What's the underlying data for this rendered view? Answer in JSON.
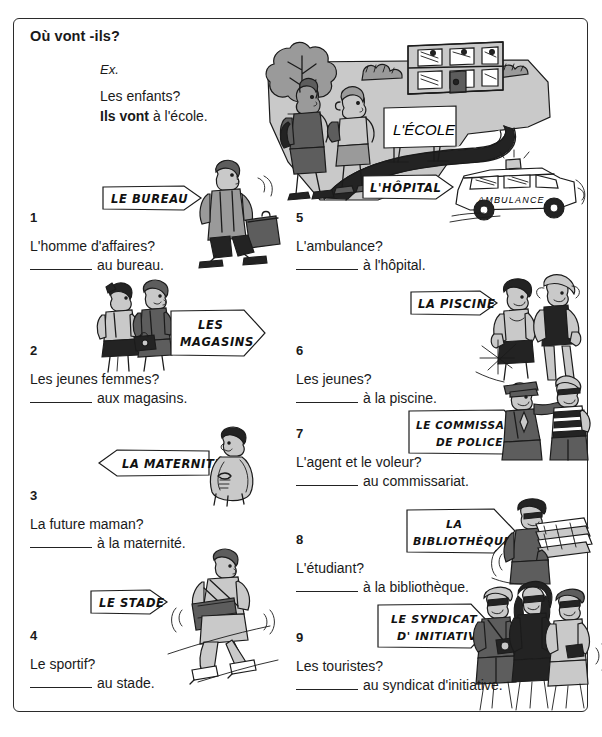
{
  "worksheet": {
    "title": "Où vont -ils?",
    "example": {
      "label": "Ex.",
      "question": "Les enfants?",
      "answer_bold": "Ils vont",
      "answer_rest": " à l'école."
    },
    "top_sign": "L'ÉCOLE"
  },
  "items": [
    {
      "number": "1",
      "question": "L'homme d'affaires?",
      "answer": "au bureau.",
      "sign": "LE BUREAU",
      "sign_dir": "right",
      "art": "businessman-walking"
    },
    {
      "number": "2",
      "question": "Les jeunes femmes?",
      "answer": "aux magasins.",
      "sign_line1": "LES",
      "sign_line2": "MAGASINS",
      "sign": "LES MAGASINS",
      "sign_dir": "right",
      "art": "two-women"
    },
    {
      "number": "3",
      "question": "La future maman?",
      "answer": "à la maternité.",
      "sign": "LA MATERNITÉ",
      "sign_dir": "left",
      "art": "pregnant-woman"
    },
    {
      "number": "4",
      "question": "Le sportif?",
      "answer": "au stade.",
      "sign": "LE STADE",
      "sign_dir": "right",
      "art": "athlete-skating"
    },
    {
      "number": "5",
      "question": "L'ambulance?",
      "answer": "à l'hôpital.",
      "sign": "L'HÔPITAL",
      "sign_dir": "right",
      "art": "ambulance"
    },
    {
      "number": "6",
      "question": "Les jeunes?",
      "answer": "à la piscine.",
      "sign": "LA PISCINE",
      "sign_dir": "right",
      "art": "two-swimmers"
    },
    {
      "number": "7",
      "question": "L'agent et le voleur?",
      "answer": "au commissariat.",
      "sign_line1": "LE COMMISSARIAT",
      "sign_line2": "DE POLICE",
      "sign": "LE COMMISSARIAT DE POLICE",
      "sign_dir": "right",
      "art": "policeman-thief"
    },
    {
      "number": "8",
      "question": "L'étudiant?",
      "answer": "à la bibliothèque.",
      "sign_line1": "LA",
      "sign_line2": "BIBLIOTHÈQUE",
      "sign": "LA BIBLIOTHÈQUE",
      "sign_dir": "right",
      "art": "student-books"
    },
    {
      "number": "9",
      "question": "Les touristes?",
      "answer": "au syndicat d'initiative.",
      "sign_line1": "LE SYNDICAT",
      "sign_line2": "D' INITIATIVE",
      "sign": "LE SYNDICAT D' INITIATIVE",
      "sign_dir": "right",
      "art": "three-tourists"
    }
  ],
  "illustration_labels": {
    "ambulance_side_text": "AMBULANCE"
  },
  "colors": {
    "ink": "#1b1b1b",
    "grey_light": "#c9c9c9",
    "grey_mid": "#9a9a9a",
    "grey_dark": "#5d5d5d",
    "paper": "#ffffff"
  }
}
